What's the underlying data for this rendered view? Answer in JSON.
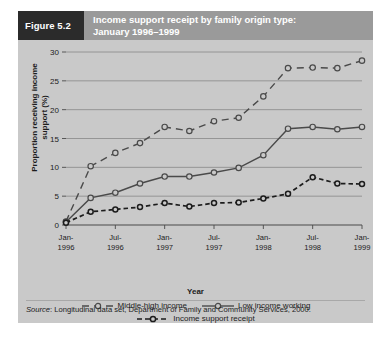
{
  "figure": {
    "tag": "Figure 5.2",
    "title_line1": "Income support receipt by family origin type:",
    "title_line2": "January 1996–1999",
    "tag_bg": "#2b2b2b",
    "header_bg": "#9a9a9a",
    "panel_bg": "#c9c9c9"
  },
  "source": {
    "label": "Source",
    "text": ": Longitudinal data set, Department of Family and Community Services, 2000."
  },
  "chart_data": {
    "type": "line",
    "title": "Income support receipt by family origin type: January 1996–1999",
    "xlabel": "Year",
    "ylabel": "Proportion receiving income support (%)",
    "ylim": [
      0,
      30
    ],
    "yticks": [
      0,
      5,
      10,
      15,
      20,
      25,
      30
    ],
    "ytick_labels": [
      "0",
      "5",
      "10",
      "15",
      "20",
      "25",
      "30"
    ],
    "grid": true,
    "legend_position": "bottom",
    "xticks": [
      0,
      2,
      4,
      6,
      8,
      10,
      12
    ],
    "xtick_labels": [
      [
        "Jan-",
        "1996"
      ],
      [
        "Jul-",
        "1996"
      ],
      [
        "Jan-",
        "1997"
      ],
      [
        "Jul-",
        "1997"
      ],
      [
        "Jan-",
        "1998"
      ],
      [
        "Jul-",
        "1998"
      ],
      [
        "Jan-",
        "1999"
      ]
    ],
    "x": [
      0,
      1,
      2,
      3,
      4,
      5,
      6,
      7,
      8,
      9,
      10,
      11,
      12
    ],
    "series": [
      {
        "name": "Middle-high income",
        "style": "dashed",
        "marker": "circle",
        "color": "#4a4a4a",
        "values": [
          0.6,
          10.2,
          12.5,
          14.2,
          17.0,
          16.3,
          18.0,
          18.6,
          22.3,
          27.2,
          27.3,
          27.2,
          28.5
        ]
      },
      {
        "name": "Low income working",
        "style": "solid",
        "marker": "circle",
        "color": "#4a4a4a",
        "values": [
          0.5,
          4.7,
          5.6,
          7.2,
          8.4,
          8.4,
          9.1,
          9.9,
          12.1,
          16.7,
          17.0,
          16.6,
          17.0
        ]
      },
      {
        "name": "Income support receipt",
        "style": "dotted-dash",
        "marker": "circle",
        "color": "#1c1c1c",
        "values": [
          0.4,
          2.3,
          2.7,
          3.1,
          3.8,
          3.2,
          3.8,
          3.9,
          4.6,
          5.4,
          8.3,
          7.2,
          7.1
        ]
      }
    ]
  }
}
